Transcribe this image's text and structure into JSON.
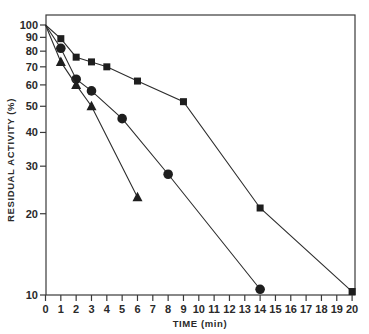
{
  "chart_data": {
    "type": "line",
    "title": "",
    "xlabel": "TIME (min)",
    "ylabel": "RESIDUAL ACTIVITY (%)",
    "x_scale": "linear",
    "y_scale": "log",
    "xlim": [
      0,
      20
    ],
    "ylim": [
      10,
      100
    ],
    "grid": false,
    "legend": null,
    "x_ticks": [
      0,
      1,
      2,
      3,
      4,
      5,
      6,
      7,
      8,
      9,
      10,
      11,
      12,
      13,
      14,
      15,
      16,
      17,
      18,
      19,
      20
    ],
    "x_tick_labels": [
      "0",
      "1",
      "2",
      "3",
      "4",
      "5",
      "6",
      "7",
      "8",
      "9",
      "10",
      "11",
      "12",
      "13",
      "14",
      "15",
      "16",
      "17",
      "18",
      "19",
      "20"
    ],
    "y_ticks": [
      10,
      20,
      30,
      40,
      50,
      60,
      70,
      80,
      90,
      100
    ],
    "y_tick_labels": [
      "10",
      "20",
      "30",
      "40",
      "50",
      "60",
      "70",
      "80",
      "90",
      "100"
    ],
    "series": [
      {
        "name": "squares",
        "marker": "square",
        "x": [
          0,
          1,
          2,
          3,
          4,
          6,
          9,
          14,
          20
        ],
        "values": [
          100,
          89,
          76,
          73,
          70,
          62,
          52,
          21,
          10.3
        ]
      },
      {
        "name": "circles",
        "marker": "circle",
        "x": [
          0,
          1,
          2,
          3,
          5,
          8,
          14
        ],
        "values": [
          100,
          82,
          63,
          57,
          45,
          28,
          10.5
        ]
      },
      {
        "name": "triangles",
        "marker": "triangle",
        "x": [
          0,
          1,
          2,
          3,
          6
        ],
        "values": [
          100,
          73,
          60,
          50,
          23
        ]
      }
    ]
  }
}
